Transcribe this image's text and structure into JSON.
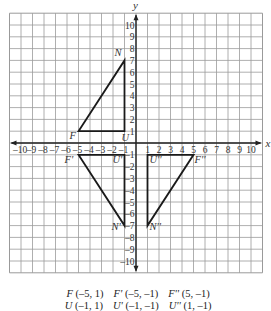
{
  "figure": {
    "x_axis_label": "x",
    "y_axis_label": "y",
    "x_ticks": [
      -10,
      -9,
      -8,
      -7,
      -6,
      -5,
      -4,
      -3,
      -2,
      -1,
      1,
      2,
      3,
      4,
      5,
      6,
      7,
      8,
      9,
      10
    ],
    "y_ticks": [
      -10,
      -9,
      -8,
      -7,
      -6,
      -5,
      -4,
      -3,
      -2,
      -1,
      1,
      2,
      3,
      4,
      5,
      6,
      7,
      8,
      9,
      10
    ],
    "grid_range": {
      "xmin": -11,
      "xmax": 11,
      "ymin": -11,
      "ymax": 11
    },
    "colors": {
      "grid": "#9a9a9a",
      "border": "#8a8a8a",
      "axis": "#222222",
      "shape": "#1a1a1a",
      "text": "#333333"
    },
    "triangles": [
      {
        "name": "FNU",
        "vertices": [
          {
            "label": "F",
            "x": -5,
            "y": 1,
            "label_dx": -9,
            "label_dy": 8
          },
          {
            "label": "N",
            "x": -1,
            "y": 7,
            "label_dx": -10,
            "label_dy": -4
          },
          {
            "label": "U",
            "x": -1,
            "y": 1,
            "label_dx": -3,
            "label_dy": 10
          }
        ]
      },
      {
        "name": "F'N'U'",
        "vertices": [
          {
            "label": "F'",
            "x": -5,
            "y": -1,
            "label_dx": -14,
            "label_dy": 8
          },
          {
            "label": "N'",
            "x": -1,
            "y": -7,
            "label_dx": -13,
            "label_dy": 4
          },
          {
            "label": "U'",
            "x": -1,
            "y": -1,
            "label_dx": -12,
            "label_dy": 8
          }
        ]
      },
      {
        "name": "F''N''U''",
        "vertices": [
          {
            "label": "U''",
            "x": 1,
            "y": -1,
            "label_dx": 2,
            "label_dy": 8
          },
          {
            "label": "F''",
            "x": 5,
            "y": -1,
            "label_dx": 1,
            "label_dy": 8
          },
          {
            "label": "N''",
            "x": 1,
            "y": -7,
            "label_dx": 2,
            "label_dy": 4
          }
        ]
      }
    ]
  },
  "caption": {
    "line1": [
      {
        "name": "F",
        "coords": "(–5, 1)"
      },
      {
        "name": "F'",
        "coords": "(–5, –1)"
      },
      {
        "name": "F''",
        "coords": "(5, –1)"
      }
    ],
    "line2": [
      {
        "name": "U",
        "coords": "(–1, 1)"
      },
      {
        "name": "U'",
        "coords": "(–1, –1)"
      },
      {
        "name": "U''",
        "coords": "(1, –1)"
      }
    ]
  }
}
